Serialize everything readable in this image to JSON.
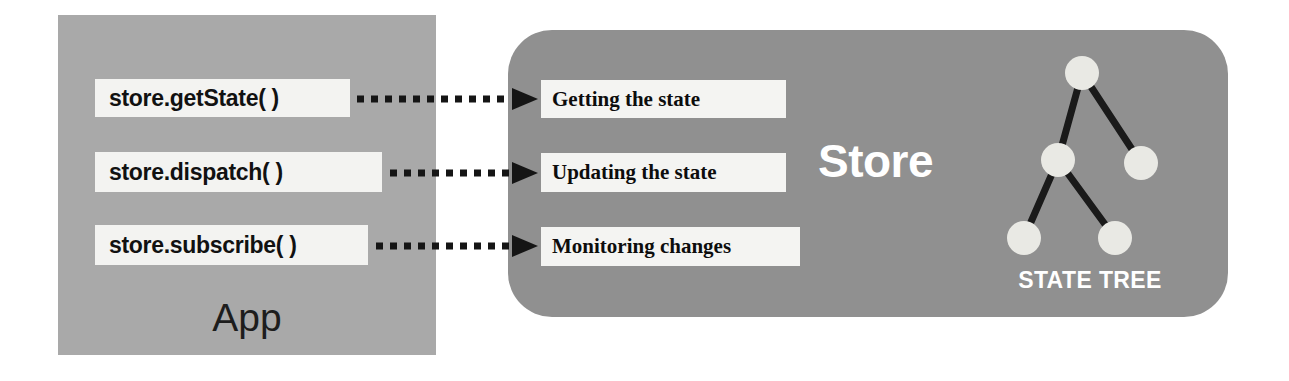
{
  "diagram": {
    "background": "#ffffff",
    "app_panel": {
      "label": "App",
      "color": "#a9a9a9",
      "methods": [
        {
          "label": "store.getState( )",
          "box": {
            "x": 95,
            "y": 79,
            "w": 255,
            "h": 38
          }
        },
        {
          "label": "store.dispatch( )",
          "box": {
            "x": 95,
            "y": 152,
            "w": 287,
            "h": 40
          }
        },
        {
          "label": "store.subscribe( )",
          "box": {
            "x": 95,
            "y": 225,
            "w": 273,
            "h": 40
          }
        }
      ]
    },
    "store_panel": {
      "label": "Store",
      "color": "#909090",
      "actions": [
        {
          "label": "Getting the state",
          "box": {
            "x": 541,
            "y": 80,
            "w": 245,
            "h": 38
          }
        },
        {
          "label": "Updating the state",
          "box": {
            "x": 541,
            "y": 153,
            "w": 245,
            "h": 39
          }
        },
        {
          "label": "Monitoring changes",
          "box": {
            "x": 541,
            "y": 227,
            "w": 259,
            "h": 39
          }
        }
      ]
    },
    "arrows": [
      {
        "name": "getstate-to-getting",
        "from_x": 357,
        "to_x": 536,
        "y": 99
      },
      {
        "name": "dispatch-to-updating",
        "from_x": 390,
        "to_x": 536,
        "y": 173
      },
      {
        "name": "subscribe-to-monitoring",
        "from_x": 376,
        "to_x": 536,
        "y": 246
      }
    ],
    "state_tree": {
      "label": "STATE TREE",
      "node_color": "#e9e9e4",
      "edge_color": "#1a1a1a",
      "node_radius": 17,
      "nodes": [
        {
          "id": "root",
          "cx": 92,
          "cy": 33
        },
        {
          "id": "child-left",
          "cx": 68,
          "cy": 120
        },
        {
          "id": "child-right",
          "cx": 151,
          "cy": 123
        },
        {
          "id": "leaf-left",
          "cx": 34,
          "cy": 198
        },
        {
          "id": "leaf-right",
          "cx": 125,
          "cy": 198
        }
      ],
      "edges": [
        {
          "from": "root",
          "to": "child-left"
        },
        {
          "from": "root",
          "to": "child-right"
        },
        {
          "from": "child-left",
          "to": "leaf-left"
        },
        {
          "from": "child-left",
          "to": "leaf-right"
        }
      ]
    }
  }
}
